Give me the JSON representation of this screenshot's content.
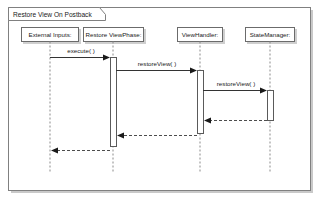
{
  "diagram": {
    "type": "uml-sequence-diagram",
    "frame": {
      "title": "Restore View On Postback",
      "x": 8,
      "y": 7,
      "width": 303,
      "height": 183
    },
    "lifelines": [
      {
        "id": "external-inputs",
        "label": "External Inputs:",
        "x": 50,
        "box_x": 21,
        "box_y": 27,
        "box_width": 58,
        "box_height": 14,
        "line_top": 41,
        "line_bottom": 172
      },
      {
        "id": "restore-view-phase",
        "label": "Restore ViewPhase:",
        "x": 113,
        "box_x": 83,
        "box_y": 27,
        "box_width": 61,
        "box_height": 14,
        "line_top": 41,
        "line_bottom": 172
      },
      {
        "id": "view-handler",
        "label": "ViewHandler:",
        "x": 200,
        "box_x": 177,
        "box_y": 27,
        "box_width": 46,
        "box_height": 14,
        "line_top": 41,
        "line_bottom": 172
      },
      {
        "id": "state-manager",
        "label": "StateManager:",
        "x": 270,
        "box_x": 245,
        "box_y": 27,
        "box_width": 50,
        "box_height": 14,
        "line_top": 41,
        "line_bottom": 172
      }
    ],
    "activations": [
      {
        "id": "activation-restore-view-phase",
        "lifeline": "restore-view-phase",
        "x": 110,
        "y": 57,
        "width": 6,
        "height": 89
      },
      {
        "id": "activation-view-handler",
        "lifeline": "view-handler",
        "x": 197,
        "y": 70,
        "width": 6,
        "height": 63
      },
      {
        "id": "activation-state-manager",
        "lifeline": "state-manager",
        "x": 267,
        "y": 90,
        "width": 6,
        "height": 30
      }
    ],
    "messages": [
      {
        "id": "message-execute",
        "label": "execute( )",
        "kind": "synchronous",
        "from": "external-inputs",
        "to": "restore-view-phase",
        "x1": 50,
        "x2": 110,
        "y": 57,
        "label_x": 81,
        "label_y": 53
      },
      {
        "id": "message-restore-view-1",
        "label": "restoreView( )",
        "kind": "synchronous",
        "from": "restore-view-phase",
        "to": "view-handler",
        "x1": 116,
        "x2": 197,
        "y": 70,
        "label_x": 157,
        "label_y": 66
      },
      {
        "id": "message-restore-view-2",
        "label": "restoreView( )",
        "kind": "synchronous",
        "from": "view-handler",
        "to": "state-manager",
        "x1": 203,
        "x2": 267,
        "y": 90,
        "label_x": 236,
        "label_y": 86
      },
      {
        "id": "message-return-state-manager",
        "label": "",
        "kind": "return",
        "from": "state-manager",
        "to": "view-handler",
        "x1": 267,
        "x2": 204,
        "y": 120,
        "label_x": 0,
        "label_y": 0
      },
      {
        "id": "message-return-view-handler",
        "label": "",
        "kind": "return",
        "from": "view-handler",
        "to": "restore-view-phase",
        "x1": 197,
        "x2": 117,
        "y": 135,
        "label_x": 0,
        "label_y": 0
      },
      {
        "id": "message-return-restore-view-phase",
        "label": "",
        "kind": "return",
        "from": "restore-view-phase",
        "to": "external-inputs",
        "x1": 110,
        "x2": 51,
        "y": 150,
        "label_x": 0,
        "label_y": 0
      }
    ],
    "colors": {
      "background": "#ffffff",
      "frame_stroke": "#808080",
      "box_stroke": "#6b6b6b",
      "lifeline_stroke": "#8a8a8a",
      "message_stroke": "#333333",
      "return_stroke": "#4d4d4d",
      "text": "#1a1a1a",
      "shadow": "#c9c9c9"
    }
  }
}
